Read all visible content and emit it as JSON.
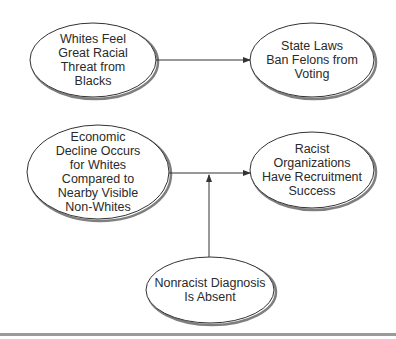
{
  "diagram": {
    "type": "causal-flow",
    "nodes": [
      {
        "id": "whites-threat",
        "lines": [
          "Whites Feel",
          "Great Racial",
          "Threat from",
          "Blacks"
        ]
      },
      {
        "id": "felon-laws",
        "lines": [
          "State Laws",
          "Ban Felons from",
          "Voting"
        ]
      },
      {
        "id": "economic-decline",
        "lines": [
          "Economic",
          "Decline Occurs",
          "for Whites",
          "Compared to",
          "Nearby Visible",
          "Non-Whites"
        ]
      },
      {
        "id": "racist-orgs",
        "lines": [
          "Racist",
          "Organizations",
          "Have Recruitment",
          "Success"
        ]
      },
      {
        "id": "nonracist-diagnosis",
        "lines": [
          "Nonracist Diagnosis",
          "Is Absent"
        ]
      }
    ],
    "edges": [
      {
        "from": "whites-threat",
        "to": "felon-laws",
        "type": "arrow"
      },
      {
        "from": "economic-decline",
        "to": "racist-orgs",
        "type": "arrow"
      },
      {
        "from": "nonracist-diagnosis",
        "to": "economic-decline->racist-orgs",
        "type": "moderator-arrow"
      }
    ],
    "colors": {
      "stroke": "#333333",
      "shadow": "#555555",
      "fill": "#ffffff",
      "rule": "#9a9a9a"
    }
  }
}
